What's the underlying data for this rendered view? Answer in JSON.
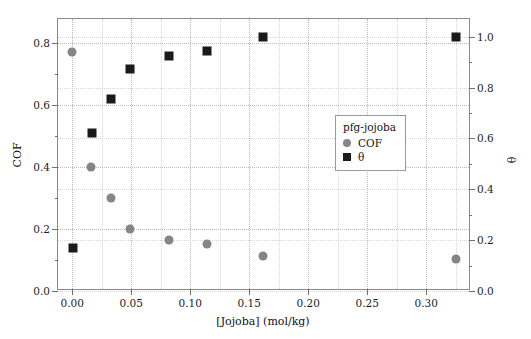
{
  "chart_data": {
    "type": "scatter",
    "title": "",
    "xlabel": "[Jojoba] (mol/kg)",
    "ylabel": "COF",
    "y2label": "θ",
    "xlim": [
      -0.012,
      0.338
    ],
    "ylim": [
      0.0,
      0.876
    ],
    "y2lim": [
      0.0,
      1.07
    ],
    "xticks": [
      "0.00",
      "0.05",
      "0.10",
      "0.15",
      "0.20",
      "0.25",
      "0.30"
    ],
    "xtick_values": [
      0.0,
      0.05,
      0.1,
      0.15,
      0.2,
      0.25,
      0.3
    ],
    "yticks": [
      "0.0",
      "0.2",
      "0.4",
      "0.6",
      "0.8"
    ],
    "ytick_values": [
      0.0,
      0.2,
      0.4,
      0.6,
      0.8
    ],
    "y2ticks": [
      "0.0",
      "0.2",
      "0.4",
      "0.6",
      "0.8",
      "1.0"
    ],
    "y2tick_values": [
      0.0,
      0.2,
      0.4,
      0.6,
      0.8,
      1.0
    ],
    "grid": true,
    "legend_position": "center",
    "legend_title": "pfg-jojoba",
    "series": [
      {
        "name": "COF",
        "axis": "left",
        "marker": "circle",
        "color": "#858585",
        "x": [
          0.0,
          0.016,
          0.033,
          0.049,
          0.082,
          0.114,
          0.162,
          0.325
        ],
        "y": [
          0.77,
          0.4,
          0.3,
          0.2,
          0.163,
          0.152,
          0.112,
          0.102
        ]
      },
      {
        "name": "θ",
        "axis": "right",
        "marker": "square",
        "color": "#1a1a1a",
        "x": [
          0.001,
          0.017,
          0.033,
          0.049,
          0.082,
          0.114,
          0.162,
          0.325
        ],
        "y": [
          0.17,
          0.62,
          0.755,
          0.875,
          0.925,
          0.945,
          1.0,
          1.0
        ]
      }
    ]
  },
  "legend": {
    "title": "pfg-jojoba",
    "entries": [
      {
        "label": "COF",
        "marker": "circle",
        "color": "#858585"
      },
      {
        "label": "θ",
        "marker": "square",
        "color": "#1a1a1a"
      }
    ]
  },
  "axes": {
    "x_title": "[Jojoba] (mol/kg)",
    "y_left_title": "COF",
    "y_right_title": "θ"
  },
  "colors": {
    "cof_marker": "#858585",
    "theta_marker": "#1a1a1a",
    "frame": "#8a8a8a",
    "grid": "#b9b9b9",
    "background": "#ffffff"
  }
}
